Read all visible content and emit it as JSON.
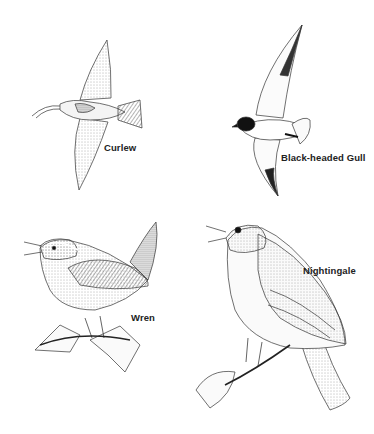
{
  "plate": {
    "birds": [
      {
        "id": "curlew",
        "label": "Curlew",
        "pose": "in flight"
      },
      {
        "id": "black-headed-gull",
        "label": "Black-headed Gull",
        "pose": "in flight"
      },
      {
        "id": "wren",
        "label": "Wren",
        "pose": "perched singing"
      },
      {
        "id": "nightingale",
        "label": "Nightingale",
        "pose": "perched singing"
      }
    ]
  }
}
